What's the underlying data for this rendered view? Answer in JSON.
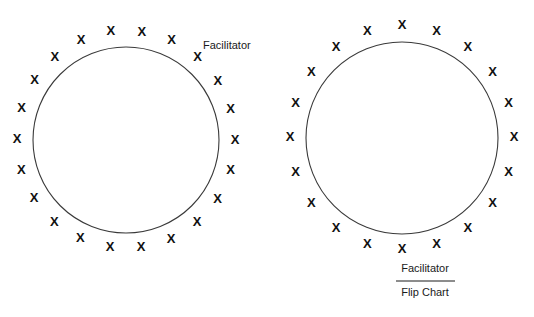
{
  "figure": {
    "background_color": "#ffffff",
    "ink_color": "#111111",
    "ring_stroke_color": "#3a3a3a",
    "seat_marker": "X",
    "panels": [
      {
        "id": "left-circle-arrangement",
        "name": "circle-seating-left",
        "circle": {
          "cx": 126,
          "cy": 140,
          "r": 93
        },
        "seat_count": 22,
        "seat_ring_radius": 109,
        "seat_start_angle_deg": -98,
        "labels": [
          {
            "name": "facilitator-label-left",
            "text": "Facilitator",
            "x": 203,
            "y": 49,
            "align": "start"
          }
        ]
      },
      {
        "id": "right-circle-arrangement",
        "name": "circle-seating-right",
        "circle": {
          "cx": 402,
          "cy": 138,
          "r": 96
        },
        "seat_count": 20,
        "seat_ring_radius": 112,
        "seat_start_angle_deg": -90,
        "labels": [
          {
            "name": "facilitator-label-right",
            "text": "Facilitator",
            "x": 425,
            "y": 272,
            "align": "middle"
          },
          {
            "name": "flip-chart-label",
            "text": "Flip Chart",
            "x": 425,
            "y": 296,
            "align": "middle"
          }
        ],
        "divider": {
          "x1": 396,
          "y1": 281,
          "x2": 455,
          "y2": 281
        }
      }
    ]
  },
  "text_items": {
    "facilitator_left": "Facilitator",
    "facilitator_right": "Facilitator",
    "flip_chart": "Flip Chart"
  }
}
